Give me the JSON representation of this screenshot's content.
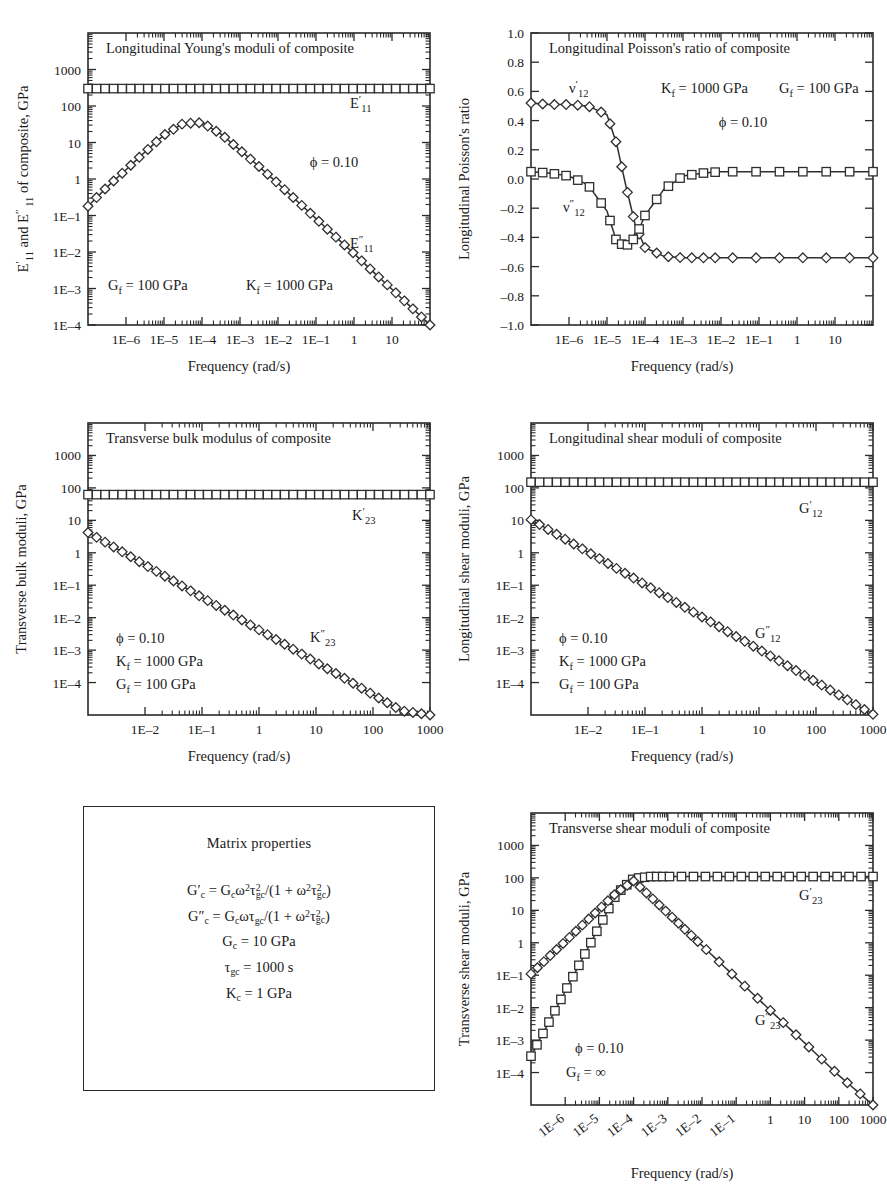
{
  "figure": {
    "panels": [
      {
        "id": "longitudinal-youngs-moduli",
        "title": "Longitudinal Young's moduli of composite",
        "ylabel_parts": [
          "E",
          "′",
          "11",
          " and E",
          "″",
          " 11",
          " of composite, GPa"
        ],
        "ylabel": "E′11 and E″ 11 of composite, GPa",
        "xlabel": "Frequency (rad/s)",
        "xticks": [
          "1E–6",
          "1E–5",
          "1E–4",
          "1E–3",
          "1E–2",
          "1E–1",
          "1",
          "10",
          "100",
          "1000"
        ],
        "yticks": [
          "1000",
          "100",
          "10",
          "1",
          "1E–1",
          "1E–2",
          "1E–3",
          "1E–4",
          "1E–5"
        ],
        "annotations": [
          {
            "text": "ϕ = 0.10",
            "x": 0.72,
            "y": 0.795
          },
          {
            "text": "G",
            "sub": "f",
            "rest": " = 100 GPa",
            "x": 0.06,
            "y": 0.115
          },
          {
            "text": "K",
            "sub": "f",
            "rest": " = 1000 GPa",
            "x": 0.4,
            "y": 0.115
          }
        ],
        "curve_labels": [
          {
            "base": "E",
            "prime": "′",
            "sub": "11",
            "x": 0.775,
            "y": 0.87
          },
          {
            "base": "E",
            "prime": "″",
            "sub": "11",
            "x": 0.775,
            "y": 0.295
          }
        ]
      },
      {
        "id": "longitudinal-poissons-ratio",
        "title": "Longitudinal Poisson's ratio of composite",
        "ylabel": "Longitudinal Poisson's ratio",
        "xlabel": "Frequency (rad/s)",
        "xticks": [
          "1E–6",
          "1E–5",
          "1E–4",
          "1E–3",
          "1E–2",
          "1E–1",
          "1",
          "10",
          "100",
          "1000"
        ],
        "yticks": [
          "1.0",
          "0.8",
          "0.6",
          "0.4",
          "0.2",
          "0.0",
          "–0.2",
          "–0.4",
          "–0.6",
          "–0.8",
          "–1.0"
        ],
        "annotations": [
          {
            "text": "K",
            "sub": "f",
            "rest": " = 1000 GPa",
            "x": 0.34,
            "y": 0.885
          },
          {
            "text": "G",
            "sub": "f",
            "rest": " = 100 GPa",
            "x": 0.68,
            "y": 0.885
          },
          {
            "text": "ϕ = 0.10",
            "x": 0.6,
            "y": 0.775
          }
        ],
        "curve_labels": [
          {
            "base": "ν",
            "prime": "′",
            "sub": "12",
            "x": 0.085,
            "y": 0.885
          },
          {
            "base": "ν",
            "prime": "″",
            "sub": "12",
            "x": 0.075,
            "y": 0.435
          }
        ]
      },
      {
        "id": "transverse-bulk-modulus",
        "title": "Transverse bulk modulus of composite",
        "ylabel": "Transverse bulk moduli, GPa",
        "xlabel": "Frequency (rad/s)",
        "xticks": [
          "1E–2",
          "1E–1",
          "1",
          "10",
          "100",
          "1000",
          "1E4"
        ],
        "yticks": [
          "1000",
          "100",
          "10",
          "1",
          "1E–1",
          "1E–2",
          "1E–3",
          "1E–4",
          "1E–5",
          "1E–6"
        ],
        "annotations": [
          {
            "text": "ϕ = 0.10",
            "x": 0.085,
            "y": 0.245
          },
          {
            "text": "K",
            "sub": "f",
            "rest": " = 1000 GPa",
            "x": 0.085,
            "y": 0.165
          },
          {
            "text": "G",
            "sub": "f",
            "rest": " = 100 GPa",
            "x": 0.085,
            "y": 0.085
          }
        ],
        "curve_labels": [
          {
            "base": "K",
            "prime": "′",
            "sub": "23",
            "x": 0.775,
            "y": 0.705
          },
          {
            "base": "K",
            "prime": "″",
            "sub": "23",
            "x": 0.655,
            "y": 0.265
          }
        ]
      },
      {
        "id": "longitudinal-shear-moduli",
        "title": "Longitudinal shear moduli of composite",
        "ylabel": "Longitudinal shear moduli, GPa",
        "xlabel": "Frequency (rad/s)",
        "xticks": [
          "1E–2",
          "1E–1",
          "1",
          "10",
          "100",
          "1000",
          "1E4"
        ],
        "yticks": [
          "1000",
          "100",
          "10",
          "1",
          "1E–1",
          "1E–2",
          "1E–3",
          "1E–4",
          "1E–5",
          "1E–6"
        ],
        "annotations": [
          {
            "text": "ϕ = 0.10",
            "x": 0.085,
            "y": 0.245
          },
          {
            "text": "K",
            "sub": "f",
            "rest": " = 1000 GPa",
            "x": 0.085,
            "y": 0.165
          },
          {
            "text": "G",
            "sub": "f",
            "rest": " = 100 GPa",
            "x": 0.085,
            "y": 0.085
          }
        ],
        "curve_labels": [
          {
            "base": "G",
            "prime": "′",
            "sub": "12",
            "x": 0.795,
            "y": 0.735
          },
          {
            "base": "G",
            "prime": "″",
            "sub": "12",
            "x": 0.655,
            "y": 0.275
          }
        ]
      },
      {
        "id": "transverse-shear-moduli",
        "title": "Transverse shear moduli of composite",
        "ylabel": "Transverse shear moduli, GPa",
        "xlabel": "Frequency (rad/s)",
        "xticks": [
          "1E–6",
          "1E–5",
          "1E–4",
          "1E–3",
          "1E–2",
          "1E–1",
          "1",
          "10",
          "100",
          "1000",
          "1E4"
        ],
        "yticks": [
          "1000",
          "100",
          "10",
          "1",
          "1E–1",
          "1E–2",
          "1E–3",
          "1E–4",
          "1E–5",
          "1E–6"
        ],
        "annotations": [
          {
            "text": "ϕ = 0.10",
            "x": 0.135,
            "y": 0.175
          },
          {
            "text": "G",
            "sub": "f",
            "rest": " = ∞",
            "x": 0.105,
            "y": 0.095
          }
        ],
        "curve_labels": [
          {
            "base": "G",
            "prime": "′",
            "sub": "23",
            "x": 0.8,
            "y": 0.745
          },
          {
            "base": "G",
            "prime": "″",
            "sub": "23",
            "x": 0.66,
            "y": 0.285
          }
        ]
      }
    ],
    "matrix_box": {
      "title": "Matrix properties",
      "equations": [
        "G′c = Gcω²τ²gc/(1 + ω²τ²gc)",
        "G″c = Gcωτgc/(1 + ω²τ²gc)",
        "Gc = 10 GPa",
        "τgc = 1000 s",
        "Kc = 1 GPa"
      ]
    }
  },
  "chart_data": [
    {
      "type": "line",
      "id": "longitudinal-youngs-moduli",
      "title": "Longitudinal Young's moduli of composite",
      "xlabel": "Frequency (rad/s)",
      "ylabel": "E′11 and E″ 11 of composite, GPa",
      "xscale": "log",
      "yscale": "log",
      "xlim": [
        1e-06,
        1000
      ],
      "ylim": [
        1e-05,
        1000
      ],
      "grid": false,
      "legend": "inline-labels",
      "params": {
        "phi": 0.1,
        "Gf_GPa": 100,
        "Kf_GPa": 1000
      },
      "series": [
        {
          "name": "E'11",
          "marker": "square",
          "x": [
            1e-06,
            3.16e-06,
            1e-05,
            3.16e-05,
            0.0001,
            0.000316,
            0.001,
            0.00316,
            0.01,
            0.0316,
            0.1,
            0.316,
            1,
            3.16,
            10,
            31.6,
            100,
            316,
            1000
          ],
          "y": [
            30,
            30,
            30,
            30,
            30,
            30,
            30,
            30,
            30,
            30,
            30,
            30,
            30,
            30,
            30,
            30,
            30,
            30,
            30
          ]
        },
        {
          "name": "E''11",
          "marker": "diamond",
          "x": [
            1e-06,
            3.16e-06,
            1e-05,
            3.16e-05,
            0.0001,
            0.000316,
            0.001,
            0.00316,
            0.01,
            0.0316,
            0.1,
            0.316,
            1,
            3.16,
            10,
            31.6,
            100,
            316,
            1000
          ],
          "y": [
            0.018,
            0.06,
            0.18,
            0.55,
            1.6,
            3.3,
            3.5,
            1.7,
            0.62,
            0.22,
            0.075,
            0.025,
            0.0082,
            0.0027,
            0.0009,
            0.00029,
            9.5e-05,
            3.1e-05,
            1e-05
          ]
        }
      ]
    },
    {
      "type": "line",
      "id": "longitudinal-poissons-ratio",
      "title": "Longitudinal Poisson's ratio of composite",
      "xlabel": "Frequency (rad/s)",
      "ylabel": "Longitudinal Poisson's ratio",
      "xscale": "log",
      "yscale": "linear",
      "xlim": [
        1e-06,
        1000
      ],
      "ylim": [
        -1.0,
        1.0
      ],
      "grid": false,
      "legend": "inline-labels",
      "params": {
        "phi": 0.1,
        "Gf_GPa": 100,
        "Kf_GPa": 1000
      },
      "series": [
        {
          "name": "v'12",
          "marker": "diamond",
          "x": [
            1e-06,
            3.16e-06,
            1e-05,
            3.16e-05,
            0.0001,
            0.00018,
            0.000316,
            0.00056,
            0.001,
            0.00316,
            0.01,
            0.0316,
            0.1,
            1,
            10,
            100,
            1000
          ],
          "y": [
            0.52,
            0.51,
            0.51,
            0.5,
            0.44,
            0.24,
            -0.05,
            -0.32,
            -0.47,
            -0.53,
            -0.54,
            -0.54,
            -0.54,
            -0.54,
            -0.54,
            -0.54,
            -0.54
          ]
        },
        {
          "name": "v''12",
          "marker": "square",
          "x": [
            1e-06,
            3.16e-06,
            1e-05,
            3.16e-05,
            0.0001,
            0.00018,
            0.000316,
            0.00056,
            0.001,
            0.00316,
            0.01,
            0.0316,
            0.1,
            1,
            10,
            100,
            1000
          ],
          "y": [
            0.05,
            0.04,
            0.02,
            -0.04,
            -0.22,
            -0.43,
            -0.46,
            -0.4,
            -0.25,
            -0.07,
            0.02,
            0.04,
            0.05,
            0.05,
            0.05,
            0.05,
            0.05
          ]
        }
      ]
    },
    {
      "type": "line",
      "id": "transverse-bulk-modulus",
      "title": "Transverse bulk modulus of composite",
      "xlabel": "Frequency (rad/s)",
      "ylabel": "Transverse bulk moduli, GPa",
      "xscale": "log",
      "yscale": "log",
      "xlim": [
        0.01,
        10000.0
      ],
      "ylim": [
        1e-06,
        1000
      ],
      "grid": false,
      "legend": "inline-labels",
      "params": {
        "phi": 0.1,
        "Kf_GPa": 1000,
        "Gf_GPa": 100
      },
      "series": [
        {
          "name": "K'23",
          "marker": "square",
          "x": [
            0.01,
            0.0316,
            0.1,
            0.316,
            1,
            3.16,
            10,
            31.6,
            100,
            316,
            1000,
            3160,
            10000.0
          ],
          "y": [
            6.2,
            6.2,
            6.2,
            6.2,
            6.2,
            6.2,
            6.2,
            6.2,
            6.2,
            6.2,
            6.2,
            6.2,
            6.2
          ]
        },
        {
          "name": "K''23",
          "marker": "diamond",
          "x": [
            0.01,
            0.0316,
            0.1,
            0.316,
            1,
            3.16,
            10,
            31.6,
            100,
            316,
            1000,
            3160,
            10000.0
          ],
          "y": [
            0.42,
            0.135,
            0.042,
            0.0135,
            0.0042,
            0.00135,
            0.00042,
            0.000135,
            4.2e-05,
            1.35e-05,
            4.2e-06,
            1.35e-06,
            5e-07
          ]
        }
      ]
    },
    {
      "type": "line",
      "id": "longitudinal-shear-moduli",
      "title": "Longitudinal shear moduli of composite",
      "xlabel": "Frequency (rad/s)",
      "ylabel": "Longitudinal shear moduli, GPa",
      "xscale": "log",
      "yscale": "log",
      "xlim": [
        0.01,
        10000.0
      ],
      "ylim": [
        1e-06,
        1000
      ],
      "grid": false,
      "legend": "inline-labels",
      "params": {
        "phi": 0.1,
        "Kf_GPa": 1000,
        "Gf_GPa": 100
      },
      "series": [
        {
          "name": "G'12",
          "marker": "square",
          "x": [
            0.01,
            0.0316,
            0.1,
            0.316,
            1,
            3.16,
            10,
            31.6,
            100,
            316,
            1000,
            3160,
            10000.0
          ],
          "y": [
            15,
            15,
            15,
            15,
            15,
            15,
            15,
            15,
            15,
            15,
            15,
            15,
            15
          ]
        },
        {
          "name": "G''12",
          "marker": "diamond",
          "x": [
            0.01,
            0.0316,
            0.1,
            0.316,
            1,
            3.16,
            10,
            31.6,
            100,
            316,
            1000,
            3160,
            10000.0
          ],
          "y": [
            1.05,
            0.33,
            0.105,
            0.033,
            0.0105,
            0.0033,
            0.00105,
            0.00033,
            0.000105,
            3.3e-05,
            1.05e-05,
            3.3e-06,
            1.05e-06
          ]
        }
      ]
    },
    {
      "type": "line",
      "id": "transverse-shear-moduli",
      "title": "Transverse shear moduli of composite",
      "xlabel": "Frequency (rad/s)",
      "ylabel": "Transverse shear moduli, GPa",
      "xscale": "log",
      "yscale": "log",
      "xlim": [
        1e-06,
        10000.0
      ],
      "ylim": [
        1e-06,
        1000
      ],
      "grid": false,
      "legend": "inline-labels",
      "params": {
        "phi": 0.1,
        "Gf": "∞"
      },
      "series": [
        {
          "name": "G'23",
          "marker": "square",
          "x": [
            1e-06,
            3.16e-06,
            1e-05,
            3.16e-05,
            0.0001,
            0.000316,
            0.001,
            0.00316,
            0.01,
            0.1,
            1,
            10,
            100,
            1000,
            10000.0
          ],
          "y": [
            3.2e-05,
            0.00032,
            0.0032,
            0.032,
            0.32,
            3.2,
            9.5,
            11,
            11,
            11,
            11,
            11,
            11,
            11,
            11
          ]
        },
        {
          "name": "G''23",
          "marker": "diamond",
          "x": [
            1e-06,
            3.16e-06,
            1e-05,
            3.16e-05,
            0.0001,
            0.000316,
            0.001,
            0.00316,
            0.01,
            0.0316,
            0.1,
            1,
            10,
            100,
            1000,
            10000.0
          ],
          "y": [
            0.011,
            0.035,
            0.11,
            0.35,
            1.1,
            3.5,
            8.0,
            2.6,
            0.82,
            0.26,
            0.082,
            0.0082,
            0.00082,
            8.2e-05,
            8.2e-06,
            9e-07
          ]
        }
      ]
    }
  ]
}
